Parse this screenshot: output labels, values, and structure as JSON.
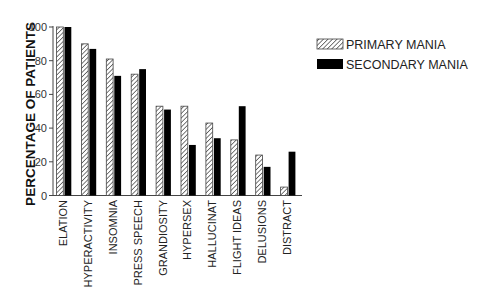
{
  "chart_data": {
    "type": "bar",
    "title": "",
    "xlabel": "",
    "ylabel": "PERCENTAGE OF PATIENTS",
    "ylim": [
      0,
      100
    ],
    "yticks": [
      0,
      20,
      40,
      60,
      80,
      100
    ],
    "grid": false,
    "legend_position": "top-right",
    "categories": [
      "ELATION",
      "HYPERACTIVITY",
      "INSOMNIA",
      "PRESS SPEECH",
      "GRANDIOSITY",
      "HYPERSEX",
      "HALLUCINAT",
      "FLIGHT IDEAS",
      "DELUSIONS",
      "DISTRACT"
    ],
    "series": [
      {
        "name": "PRIMARY MANIA",
        "pattern": "hatched",
        "values": [
          100,
          90,
          81,
          72,
          53,
          53,
          43,
          33,
          24,
          5
        ]
      },
      {
        "name": "SECONDARY MANIA",
        "pattern": "solid",
        "color": "#000000",
        "values": [
          100,
          87,
          71,
          75,
          51,
          30,
          34,
          53,
          17,
          26
        ]
      }
    ]
  }
}
